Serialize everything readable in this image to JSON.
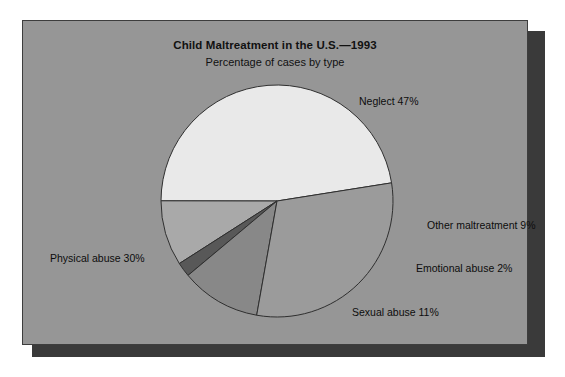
{
  "chart_data": {
    "type": "pie",
    "title": "Child Maltreatment in the U.S.—1993",
    "subtitle": "Percentage of cases by type",
    "xlabel": "",
    "ylabel": "",
    "legend_position": "none",
    "grid": false,
    "value_unit": "percent",
    "categories": [
      "Neglect",
      "Other maltreatment",
      "Emotional abuse",
      "Sexual abuse",
      "Physical abuse"
    ],
    "values": [
      47,
      9,
      2,
      11,
      30
    ],
    "labels": [
      "Neglect 47%",
      "Other maltreatment 9%",
      "Emotional abuse 2%",
      "Sexual abuse 11%",
      "Physical abuse 30%"
    ],
    "slice_colors": [
      "#e9e9e9",
      "#a9a9a9",
      "#585858",
      "#888888",
      "#9b9b9b"
    ],
    "slices": [
      {
        "name": "Neglect",
        "value": 47,
        "label": "Neglect 47%",
        "color": "#e9e9e9"
      },
      {
        "name": "Other maltreatment",
        "value": 9,
        "label": "Other maltreatment 9%",
        "color": "#a9a9a9"
      },
      {
        "name": "Emotional abuse",
        "value": 2,
        "label": "Emotional abuse 2%",
        "color": "#585858"
      },
      {
        "name": "Sexual abuse",
        "value": 11,
        "label": "Sexual abuse 11%",
        "color": "#888888"
      },
      {
        "name": "Physical abuse",
        "value": 30,
        "label": "Physical abuse 30%",
        "color": "#9b9b9b"
      }
    ]
  },
  "panel": {
    "background_color": "#969696",
    "border_color": "#3d3d3d",
    "shadow_color": "#3a3a3a",
    "page_background": "#ffffff"
  }
}
